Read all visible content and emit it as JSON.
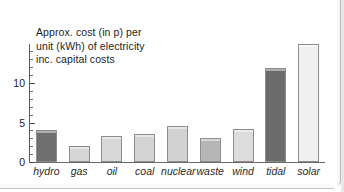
{
  "chart_data": {
    "type": "bar",
    "title": "Approx. cost (in p) per\nunit (kWh) of electricity\ninc. capital costs",
    "xlabel": "",
    "ylabel": "",
    "ylim": [
      0,
      15
    ],
    "y_ticks_major": [
      0,
      5,
      10
    ],
    "y_tick_labels": [
      "0",
      "5",
      "10"
    ],
    "y_ticks_minor": [
      1,
      2,
      3,
      4,
      6,
      7,
      8,
      9,
      11,
      12,
      13,
      14
    ],
    "grid": false,
    "legend": "none",
    "clipped_note": "solar bar extends above the top of the plot frame",
    "categories": [
      "hydro",
      "gas",
      "oil",
      "coal",
      "nuclear",
      "waste",
      "wind",
      "tidal",
      "solar"
    ],
    "values": [
      4.0,
      2.0,
      3.3,
      3.5,
      4.6,
      3.0,
      4.2,
      11.9,
      15.0
    ],
    "bar_colors": [
      "#6f6f6f",
      "#d6d6d6",
      "#d8d8d8",
      "#d4d4d4",
      "#d2d2d2",
      "#b6b6b6",
      "#dcdcdc",
      "#6b6b6b",
      "#f0f0f0"
    ]
  },
  "axis": {
    "tick_0": "0",
    "tick_5": "5",
    "tick_10": "10"
  },
  "style": {
    "axis_color": "#5c5c5c",
    "text_color": "#1d1d1d",
    "bar_border": "#8d8d8d",
    "background": "#ffffff"
  }
}
